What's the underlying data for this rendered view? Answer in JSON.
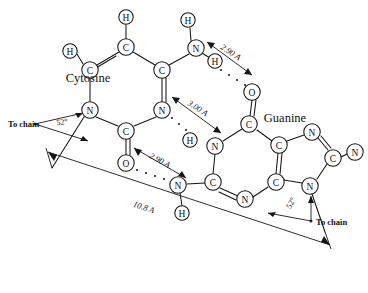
{
  "figure": {
    "molecules": [
      {
        "id": "cytosine",
        "label": "Cytosine",
        "x": 88,
        "y": 78
      },
      {
        "id": "guanine",
        "label": "Guanine",
        "x": 285,
        "y": 118
      }
    ],
    "chain_labels": [
      {
        "id": "to-chain-left",
        "label": "To chain",
        "x": 8,
        "y": 124
      },
      {
        "id": "to-chain-right",
        "label": "To chain",
        "x": 303,
        "y": 222
      }
    ],
    "angles": [
      {
        "id": "angle-cytosine",
        "label": "52°",
        "x": 75,
        "y": 127
      },
      {
        "id": "angle-guanine",
        "label": "52°",
        "x": 285,
        "y": 206
      }
    ],
    "distances": [
      {
        "id": "hbond-top",
        "label": "2.90 A",
        "x": 228,
        "y": 52
      },
      {
        "id": "hbond-middle",
        "label": "3.00 A",
        "x": 195,
        "y": 106
      },
      {
        "id": "hbond-bottom",
        "label": "2.90 A",
        "x": 152,
        "y": 157
      },
      {
        "id": "overall-span",
        "label": "10.8 A",
        "x": 144,
        "y": 214
      }
    ],
    "atoms": {
      "cytosine": [
        {
          "id": "c-h-top",
          "symbol": "H",
          "x": 126,
          "y": 17,
          "r": 7.2
        },
        {
          "id": "c-c5",
          "symbol": "C",
          "x": 126,
          "y": 47,
          "r": 8.2
        },
        {
          "id": "c-h-left",
          "symbol": "H",
          "x": 70,
          "y": 51,
          "r": 7.2
        },
        {
          "id": "c-c6",
          "symbol": "C",
          "x": 90,
          "y": 70,
          "r": 8.2
        },
        {
          "id": "c-c4",
          "symbol": "C",
          "x": 162,
          "y": 70,
          "r": 8.2
        },
        {
          "id": "c-n1",
          "symbol": "N",
          "x": 90,
          "y": 110,
          "r": 8.2
        },
        {
          "id": "c-n3",
          "symbol": "N",
          "x": 162,
          "y": 110,
          "r": 8.2
        },
        {
          "id": "c-c2",
          "symbol": "C",
          "x": 126,
          "y": 131,
          "r": 8.2
        },
        {
          "id": "c-o2",
          "symbol": "O",
          "x": 126,
          "y": 163,
          "r": 8.2
        },
        {
          "id": "c-n4",
          "symbol": "N",
          "x": 196,
          "y": 48,
          "r": 8.2
        },
        {
          "id": "c-n4-h-up",
          "symbol": "H",
          "x": 188,
          "y": 20,
          "r": 7.2
        },
        {
          "id": "c-n4-h-dn",
          "symbol": "H",
          "x": 215,
          "y": 61,
          "r": 7.2
        }
      ],
      "guanine": [
        {
          "id": "g-o6",
          "symbol": "O",
          "x": 252,
          "y": 92,
          "r": 8.2
        },
        {
          "id": "g-c6",
          "symbol": "C",
          "x": 249,
          "y": 124,
          "r": 8.2
        },
        {
          "id": "g-n1",
          "symbol": "N",
          "x": 215,
          "y": 146,
          "r": 8.2
        },
        {
          "id": "g-n1-h",
          "symbol": "H",
          "x": 190,
          "y": 140,
          "r": 7.2
        },
        {
          "id": "g-c2",
          "symbol": "C",
          "x": 213,
          "y": 182,
          "r": 8.2
        },
        {
          "id": "g-n2",
          "symbol": "N",
          "x": 178,
          "y": 185,
          "r": 8.2
        },
        {
          "id": "g-n2-h",
          "symbol": "H",
          "x": 182,
          "y": 213,
          "r": 7.2
        },
        {
          "id": "g-n3",
          "symbol": "N",
          "x": 245,
          "y": 199,
          "r": 8.2
        },
        {
          "id": "g-c4",
          "symbol": "C",
          "x": 276,
          "y": 182,
          "r": 8.2
        },
        {
          "id": "g-c5",
          "symbol": "C",
          "x": 279,
          "y": 145,
          "r": 8.2
        },
        {
          "id": "g-n7",
          "symbol": "N",
          "x": 312,
          "y": 132,
          "r": 8.2
        },
        {
          "id": "g-c8",
          "symbol": "C",
          "x": 333,
          "y": 158,
          "r": 8.2
        },
        {
          "id": "g-n9",
          "symbol": "N",
          "x": 310,
          "y": 186,
          "r": 8.2
        },
        {
          "id": "g-n-amino",
          "symbol": "N",
          "x": 355,
          "y": 152,
          "r": 8.2
        }
      ]
    }
  }
}
